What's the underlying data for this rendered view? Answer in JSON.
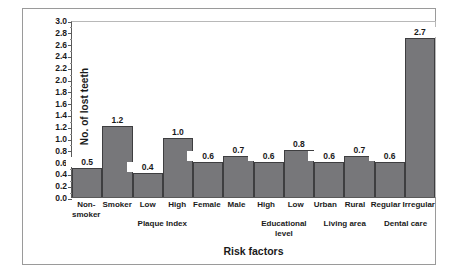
{
  "chart_data": {
    "type": "bar",
    "title": "",
    "xlabel": "Risk factors",
    "ylabel": "No. of lost teeth",
    "ylim": [
      0.0,
      3.0
    ],
    "ytick_step": 0.2,
    "grid": false,
    "legend": "none",
    "bar_color": "#77777a",
    "bar_edge_color": "#3e3e40",
    "categories": [
      "Non-smoker",
      "Smoker",
      "Low",
      "High",
      "Female",
      "Male",
      "High",
      "Low",
      "Urban",
      "Rural",
      "Regular",
      "Irregular"
    ],
    "values": [
      0.5,
      1.2,
      0.4,
      1.0,
      0.6,
      0.7,
      0.6,
      0.8,
      0.6,
      0.7,
      0.6,
      2.7
    ],
    "value_labels": [
      "0.5",
      "1.2",
      "0.4",
      "1.0",
      "0.6",
      "0.7",
      "0.6",
      "0.8",
      "0.6",
      "0.7",
      "0.6",
      "2.7"
    ],
    "ytick_labels": [
      "3.0",
      "2.8",
      "2.6",
      "2.4",
      "2.2",
      "2.0",
      "1.8",
      "1.6",
      "1.4",
      "1.2",
      "1.0",
      "0.8",
      "0.6",
      "0.4",
      "0.2",
      "0.0"
    ],
    "category_lines": [
      [
        "Non-",
        "smoker"
      ],
      [
        "Smoker"
      ],
      [
        "Low"
      ],
      [
        "High"
      ],
      [
        "Female"
      ],
      [
        "Male"
      ],
      [
        "High"
      ],
      [
        "Low"
      ],
      [
        "Urban"
      ],
      [
        "Rural"
      ],
      [
        "Regular"
      ],
      [
        "Irregular"
      ]
    ],
    "groups": [
      {
        "label": "Plaque Index",
        "start": 2,
        "end": 3
      },
      {
        "label": "Educational level",
        "start": 6,
        "end": 7
      },
      {
        "label": "Living area",
        "start": 8,
        "end": 9
      },
      {
        "label": "Dental care",
        "start": 10,
        "end": 11
      }
    ]
  }
}
